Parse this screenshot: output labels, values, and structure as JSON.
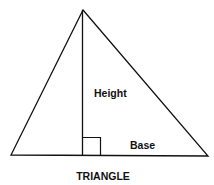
{
  "diagram": {
    "title": "TRIANGLE",
    "labels": {
      "height": "Height",
      "base": "Base"
    },
    "colors": {
      "stroke": "#111111",
      "background": "#ffffff"
    }
  }
}
